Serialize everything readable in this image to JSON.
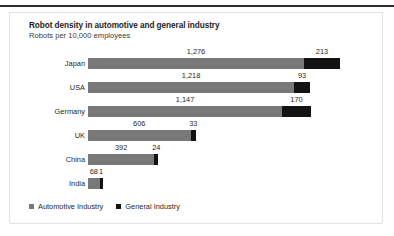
{
  "chart_data": {
    "type": "bar",
    "orientation": "horizontal",
    "stacked": true,
    "title": "Robot density in automotive and general industry",
    "subtitle": "Robots per 10,000 employees",
    "xlabel": "",
    "ylabel": "",
    "grid": false,
    "legend_position": "bottom-left",
    "categories": [
      "Japan",
      "USA",
      "Germany",
      "UK",
      "China",
      "India"
    ],
    "series": [
      {
        "name": "Automotive Industry",
        "color": "#787878",
        "values": [
          1276,
          1218,
          1147,
          606,
          392,
          68
        ],
        "labels": [
          "1,276",
          "1,218",
          "1,147",
          "606",
          "392",
          "68"
        ]
      },
      {
        "name": "General Industry",
        "color": "#131313",
        "values": [
          213,
          93,
          170,
          33,
          24,
          1
        ],
        "labels": [
          "213",
          "93",
          "170",
          "33",
          "24",
          "1"
        ]
      }
    ],
    "totals": [
      1489,
      1311,
      1317,
      639,
      416,
      69
    ],
    "xlim": [
      0,
      1489
    ]
  },
  "legend": {
    "items": [
      {
        "label": "Automotive Industry",
        "color": "#787878"
      },
      {
        "label": "General Industry",
        "color": "#131313"
      }
    ]
  }
}
